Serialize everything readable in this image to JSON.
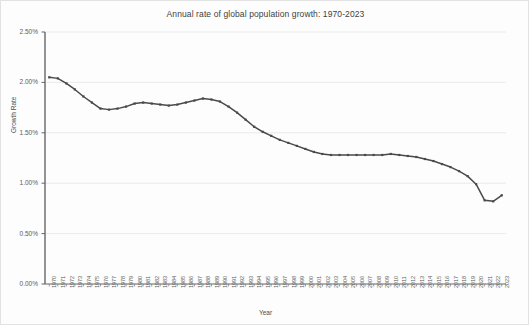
{
  "chart_data": {
    "type": "line",
    "title": "Annual rate of global population growth: 1970-2023",
    "xlabel": "Year",
    "ylabel": "Growth Rate",
    "ylim": [
      0.0,
      2.5
    ],
    "ytick_labels": [
      "0.00%",
      "0.50%",
      "1.00%",
      "1.50%",
      "2.00%",
      "2.50%"
    ],
    "ytick_values": [
      0.0,
      0.5,
      1.0,
      1.5,
      2.0,
      2.5
    ],
    "grid": "horizontal",
    "legend": "none",
    "line_color": "#4a4a4a",
    "marker": "square",
    "categories": [
      "1970",
      "1971",
      "1972",
      "1973",
      "1974",
      "1975",
      "1976",
      "1977",
      "1978",
      "1979",
      "1980",
      "1981",
      "1982",
      "1983",
      "1984",
      "1985",
      "1986",
      "1987",
      "1988",
      "1989",
      "1990",
      "1991",
      "1992",
      "1993",
      "1994",
      "1995",
      "1996",
      "1997",
      "1998",
      "1999",
      "2000",
      "2001",
      "2002",
      "2003",
      "2004",
      "2005",
      "2006",
      "2007",
      "2008",
      "2009",
      "2010",
      "2011",
      "2012",
      "2013",
      "2014",
      "2015",
      "2016",
      "2017",
      "2018",
      "2019",
      "2020",
      "2021",
      "2022",
      "2023"
    ],
    "values": [
      2.05,
      2.04,
      1.99,
      1.93,
      1.86,
      1.8,
      1.74,
      1.73,
      1.74,
      1.76,
      1.79,
      1.8,
      1.79,
      1.78,
      1.77,
      1.78,
      1.8,
      1.82,
      1.84,
      1.83,
      1.81,
      1.76,
      1.7,
      1.63,
      1.56,
      1.51,
      1.47,
      1.43,
      1.4,
      1.37,
      1.34,
      1.31,
      1.29,
      1.28,
      1.28,
      1.28,
      1.28,
      1.28,
      1.28,
      1.28,
      1.29,
      1.28,
      1.27,
      1.26,
      1.24,
      1.22,
      1.19,
      1.16,
      1.12,
      1.07,
      0.99,
      0.83,
      0.82,
      0.88
    ]
  }
}
